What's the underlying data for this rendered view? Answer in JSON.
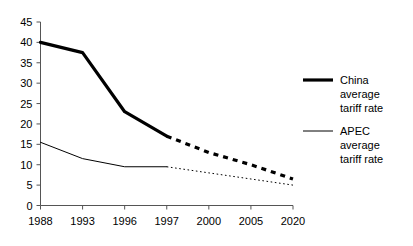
{
  "chart_data": {
    "type": "line",
    "title": "",
    "subtitle": "",
    "xlabel": "",
    "ylabel": "",
    "categories": [
      "1988",
      "1993",
      "1996",
      "1997",
      "2000",
      "2005",
      "2020"
    ],
    "ylim": [
      0,
      45
    ],
    "ytick_labels": [
      "0",
      "5",
      "10",
      "15",
      "20",
      "25",
      "30",
      "35",
      "40",
      "45"
    ],
    "ytick_values": [
      0,
      5,
      10,
      15,
      20,
      25,
      30,
      35,
      40,
      45
    ],
    "grid": false,
    "legend_position": "right",
    "series": [
      {
        "name": "China average tariff rate",
        "legend_label_lines": [
          "China",
          "average",
          "tariff rate"
        ],
        "style": "thick",
        "color": "#000000",
        "values": [
          40,
          37.5,
          23,
          17,
          13,
          10,
          6.5
        ],
        "solid_through_index": 3,
        "dashed_from_index": 3
      },
      {
        "name": "APEC average tariff rate",
        "legend_label_lines": [
          "APEC",
          "average",
          "tariff rate"
        ],
        "style": "thin",
        "color": "#000000",
        "values": [
          15.5,
          11.5,
          9.5,
          9.5,
          8,
          6.5,
          5
        ],
        "solid_through_index": 3,
        "dashed_from_index": 3
      }
    ]
  },
  "legend": {
    "items": [
      {
        "key": "china",
        "swatch": "thick-line-swatch",
        "lines": [
          "China",
          "average",
          "tariff rate"
        ]
      },
      {
        "key": "apec",
        "swatch": "thin-line-swatch",
        "lines": [
          "APEC",
          "average",
          "tariff rate"
        ]
      }
    ]
  },
  "axis": {
    "y_labels": [
      "45",
      "40",
      "35",
      "30",
      "25",
      "20",
      "15",
      "10",
      "5",
      "0"
    ],
    "x_labels": [
      "1988",
      "1993",
      "1996",
      "1997",
      "2000",
      "2005",
      "2020"
    ]
  },
  "colors": {
    "ink": "#000000",
    "axis": "#555555",
    "background": "#ffffff"
  }
}
